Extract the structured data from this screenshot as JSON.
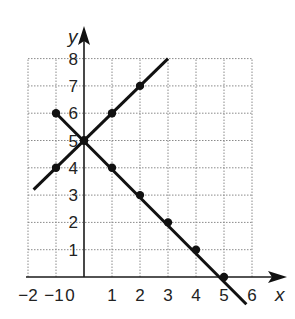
{
  "chart_data": {
    "type": "line",
    "title": "",
    "xlabel": "x",
    "ylabel": "y",
    "xlim": [
      -2,
      6
    ],
    "ylim": [
      0,
      8
    ],
    "grid": true,
    "x_tick_labels": [
      "−2",
      "−1",
      "0",
      "1",
      "2",
      "3",
      "4",
      "5",
      "6"
    ],
    "y_tick_labels": [
      "1",
      "2",
      "3",
      "4",
      "5",
      "6",
      "7",
      "8"
    ],
    "series": [
      {
        "name": "rising line (y = x + 5)",
        "marked_points": [
          [
            -1,
            4
          ],
          [
            0,
            5
          ],
          [
            1,
            6
          ],
          [
            2,
            7
          ]
        ],
        "line_extent": [
          [
            -1.8,
            3.2
          ],
          [
            3,
            8
          ]
        ]
      },
      {
        "name": "falling line (y = -x + 5)",
        "marked_points": [
          [
            -1,
            6
          ],
          [
            0,
            5
          ],
          [
            1,
            4
          ],
          [
            2,
            3
          ],
          [
            3,
            2
          ],
          [
            4,
            1
          ],
          [
            5,
            0
          ]
        ],
        "line_extent": [
          [
            -1,
            6
          ],
          [
            5.8,
            -1
          ]
        ]
      }
    ]
  },
  "labels": {
    "x_axis": "x",
    "y_axis": "y",
    "ticks_x": [
      {
        "v": -2,
        "t": "−2"
      },
      {
        "v": -1,
        "t": "−1"
      },
      {
        "v": 0,
        "t": "0"
      },
      {
        "v": 1,
        "t": "1"
      },
      {
        "v": 2,
        "t": "2"
      },
      {
        "v": 3,
        "t": "3"
      },
      {
        "v": 4,
        "t": "4"
      },
      {
        "v": 5,
        "t": "5"
      },
      {
        "v": 6,
        "t": "6"
      }
    ],
    "ticks_y": [
      "1",
      "2",
      "3",
      "4",
      "5",
      "6",
      "7",
      "8"
    ]
  }
}
